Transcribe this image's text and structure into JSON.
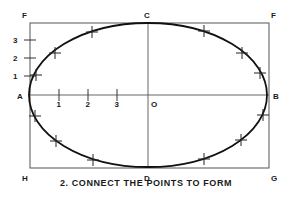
{
  "diagram": {
    "rectangle": {
      "x": 30,
      "y": 23,
      "width": 239,
      "height": 145,
      "stroke": "#555555"
    },
    "center": {
      "x": 148,
      "y": 95,
      "label": "O"
    },
    "ellipse": {
      "cx": 148,
      "cy": 95,
      "rx": 119,
      "ry": 72,
      "stroke": "#111111"
    },
    "corner_labels": [
      {
        "id": "F-left",
        "text": "F",
        "x": 22,
        "y": 18
      },
      {
        "id": "C",
        "text": "C",
        "x": 144,
        "y": 18
      },
      {
        "id": "F-right",
        "text": "F",
        "x": 271,
        "y": 18
      },
      {
        "id": "A",
        "text": "A",
        "x": 17,
        "y": 99
      },
      {
        "id": "B",
        "text": "B",
        "x": 273,
        "y": 99
      },
      {
        "id": "H",
        "text": "H",
        "x": 22,
        "y": 181
      },
      {
        "id": "D",
        "text": "D",
        "x": 144,
        "y": 181
      },
      {
        "id": "G",
        "text": "G",
        "x": 271,
        "y": 181
      }
    ],
    "vertical_divisions": [
      {
        "label": "3",
        "y": 40
      },
      {
        "label": "2",
        "y": 58
      },
      {
        "label": "1",
        "y": 76
      }
    ],
    "horizontal_divisions": [
      {
        "label": "1",
        "x": 59
      },
      {
        "label": "2",
        "x": 88
      },
      {
        "label": "3",
        "x": 117
      }
    ],
    "plotted_points": [
      {
        "x": 36,
        "y": 75
      },
      {
        "x": 55,
        "y": 53
      },
      {
        "x": 92,
        "y": 32
      },
      {
        "x": 204,
        "y": 31
      },
      {
        "x": 242,
        "y": 53
      },
      {
        "x": 260,
        "y": 73
      },
      {
        "x": 35,
        "y": 116
      },
      {
        "x": 56,
        "y": 141
      },
      {
        "x": 93,
        "y": 160
      },
      {
        "x": 204,
        "y": 159
      },
      {
        "x": 241,
        "y": 140
      },
      {
        "x": 263,
        "y": 115
      }
    ],
    "caption": "2. CONNECT THE POINTS TO FORM"
  }
}
